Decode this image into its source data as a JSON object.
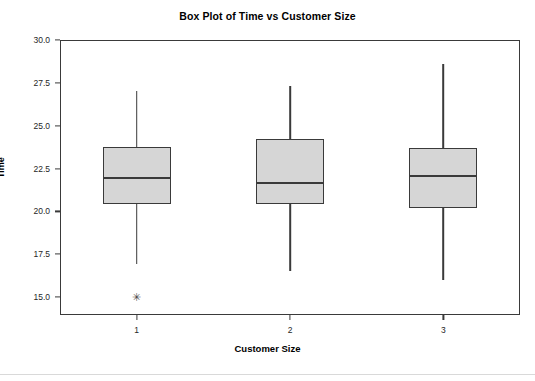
{
  "chart_data": {
    "type": "box",
    "title": "Box Plot of Time vs Customer Size",
    "xlabel": "Customer Size",
    "ylabel": "Time",
    "categories": [
      "1",
      "2",
      "3"
    ],
    "ylim": [
      14.2,
      30.0
    ],
    "yticks": [
      30.0,
      27.5,
      25.0,
      22.5,
      20.0,
      17.5,
      15.0
    ],
    "ytick_labels": [
      "30.0",
      "27.5",
      "25.0",
      "22.5",
      "20.0",
      "17.5",
      "15.0"
    ],
    "grid": false,
    "legend": false,
    "box_fill_color": "#d6d6d6",
    "line_color": "#3a3a3a",
    "boxes": [
      {
        "category": "1",
        "whisker_low": 16.9,
        "q1": 20.4,
        "median": 22.0,
        "q3": 23.75,
        "whisker_high": 27.0,
        "outliers": [
          15.0
        ]
      },
      {
        "category": "2",
        "whisker_low": 16.5,
        "q1": 20.4,
        "median": 21.7,
        "q3": 24.2,
        "whisker_high": 27.3,
        "outliers": []
      },
      {
        "category": "3",
        "whisker_low": 16.0,
        "q1": 20.2,
        "median": 22.1,
        "q3": 23.7,
        "whisker_high": 28.6,
        "outliers": []
      }
    ]
  },
  "axis": {
    "outlier_glyph": "✳"
  }
}
